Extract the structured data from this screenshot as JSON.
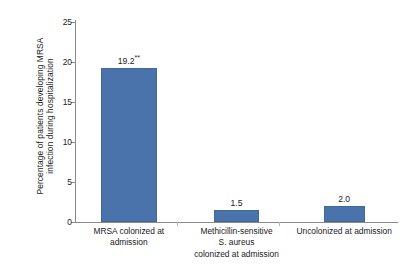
{
  "chart_data": {
    "type": "bar",
    "title": "",
    "xlabel": "",
    "ylabel": "Percentage of patients developing MRSA infection during hospitalization",
    "ylabel_lines": [
      "Percentage of patients developing MRSA",
      "infection during hospitalization"
    ],
    "categories": [
      "MRSA colonized at admission",
      "Methicillin-sensitive S. aureus colonized at admission",
      "Uncolonized at admission"
    ],
    "category_lines": [
      [
        "MRSA colonized at",
        "admission"
      ],
      [
        "Methicillin-sensitive",
        "S. aureus",
        "colonized at admission"
      ],
      [
        "Uncolonized at admission"
      ]
    ],
    "values": [
      19.2,
      1.5,
      2.0
    ],
    "data_labels": [
      "19.2",
      "1.5",
      "2.0"
    ],
    "annotations": [
      {
        "category": "MRSA colonized at admission",
        "marker": "**",
        "meaning": "significance marker on 19.2"
      }
    ],
    "ylim": [
      0,
      25
    ],
    "ytick_values": [
      0,
      5,
      10,
      15,
      20,
      25
    ],
    "ytick_labels": [
      "0",
      "5",
      "10",
      "15",
      "20",
      "25"
    ],
    "grid": false,
    "legend": null,
    "bar_color": "#4a72ab",
    "axis_color": "#8a8a8a",
    "background": "#ffffff"
  }
}
